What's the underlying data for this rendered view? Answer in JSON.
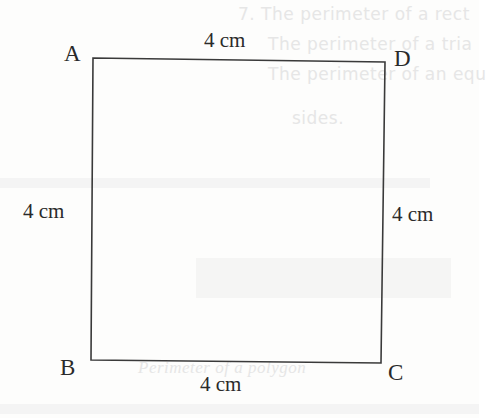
{
  "figure": {
    "shape": "square",
    "vertices": [
      {
        "name": "A",
        "x": 93,
        "y": 58
      },
      {
        "name": "D",
        "x": 385,
        "y": 62
      },
      {
        "name": "C",
        "x": 381,
        "y": 363
      },
      {
        "name": "B",
        "x": 91,
        "y": 360
      }
    ],
    "vertex_labels": {
      "a": "A",
      "b": "B",
      "c": "C",
      "d": "D"
    },
    "side_labels": {
      "top": "4 cm",
      "left": "4 cm",
      "right": "4 cm",
      "bottom": "4 cm"
    },
    "stroke_color": "#3a3a3a",
    "text_color": "#2a2a2a"
  },
  "background_bleed": {
    "lines": [
      "7. The perimeter of a rect",
      "The perimeter of a tria",
      "The perimeter of an equ",
      "sides.",
      "Perimeter of a polygon"
    ]
  }
}
